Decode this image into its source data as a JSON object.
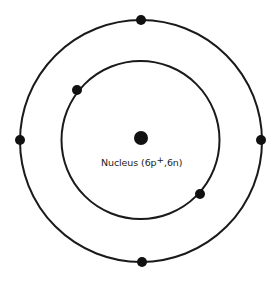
{
  "diagram": {
    "type": "atom-bohr-model",
    "nucleus": {
      "label_prefix": "Nucleus (6p",
      "label_charge": "+",
      "label_suffix": ",6n)",
      "protons": 6,
      "neutrons": 6,
      "cx": 141,
      "cy": 138,
      "r": 7
    },
    "shells": [
      {
        "name": "inner-shell",
        "cx": 140.5,
        "cy": 140,
        "r": 79,
        "electrons": [
          {
            "cx": 77,
            "cy": 90
          },
          {
            "cx": 200,
            "cy": 194
          }
        ]
      },
      {
        "name": "outer-shell",
        "cx": 141,
        "cy": 141,
        "r": 121,
        "electrons": [
          {
            "cx": 141,
            "cy": 20
          },
          {
            "cx": 20,
            "cy": 140
          },
          {
            "cx": 261,
            "cy": 140
          },
          {
            "cx": 142,
            "cy": 262
          }
        ]
      }
    ],
    "colors": {
      "stroke": "#1a1a1a",
      "fill": "#111111",
      "background": "#ffffff"
    }
  }
}
